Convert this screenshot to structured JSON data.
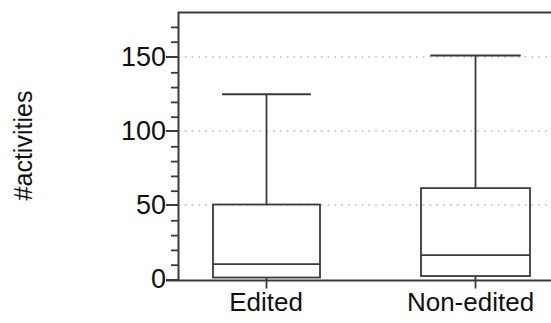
{
  "chart_data": {
    "type": "box",
    "title": "",
    "xlabel": "",
    "ylabel": "#activities",
    "categories": [
      "Edited",
      "Non-edited"
    ],
    "ylim": [
      0,
      180
    ],
    "yticks": [
      0,
      50,
      100,
      150
    ],
    "ytick_labels": [
      "0",
      "50",
      "100",
      "150"
    ],
    "minor_tick_interval": 10,
    "grid": "horizontal-dotted-at-major-ticks",
    "legend": null,
    "series": [
      {
        "name": "Edited",
        "whisker_low": 0,
        "q1": 2,
        "median": 11,
        "q3": 51,
        "whisker_high": 125,
        "outliers": []
      },
      {
        "name": "Non-edited",
        "whisker_low": 0,
        "q1": 3,
        "median": 17,
        "q3": 62,
        "whisker_high": 151,
        "outliers": []
      }
    ]
  },
  "axis": {
    "y_label_text": "#activities",
    "tick_0": "0",
    "tick_50": "50",
    "tick_100": "100",
    "tick_150": "150"
  },
  "categories": {
    "edited": "Edited",
    "non_edited": "Non-edited"
  },
  "colors": {
    "line": "#3a3a3a",
    "text": "#111111",
    "grid": "#b9b9b9",
    "background": "#ffffff"
  }
}
